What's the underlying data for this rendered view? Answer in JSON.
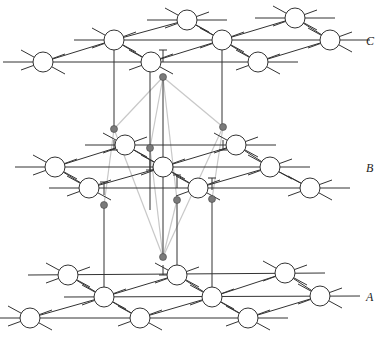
{
  "layers": [
    {
      "label": "C",
      "label_pos": [
        368,
        45
      ],
      "nodes": [
        [
          187,
          20
        ],
        [
          295,
          18
        ],
        [
          114,
          40
        ],
        [
          222,
          40
        ],
        [
          330,
          40
        ],
        [
          43,
          62
        ],
        [
          151,
          62
        ],
        [
          258,
          62
        ]
      ]
    },
    {
      "label": "B",
      "label_pos": [
        368,
        172
      ],
      "nodes": [
        [
          125,
          145
        ],
        [
          236,
          145
        ],
        [
          55,
          167
        ],
        [
          163,
          167
        ],
        [
          270,
          167
        ],
        [
          89,
          188
        ],
        [
          198,
          188
        ],
        [
          310,
          188
        ]
      ]
    },
    {
      "label": "A",
      "label_pos": [
        368,
        301
      ],
      "nodes": [
        [
          68,
          275
        ],
        [
          177,
          275
        ],
        [
          285,
          273
        ],
        [
          104,
          297
        ],
        [
          212,
          297
        ],
        [
          320,
          296
        ],
        [
          30,
          318
        ],
        [
          140,
          318
        ],
        [
          248,
          318
        ]
      ]
    }
  ],
  "sites": [
    [
      163,
      77
    ],
    [
      114,
      129
    ],
    [
      223,
      127
    ],
    [
      150,
      148
    ],
    [
      177,
      200
    ],
    [
      104,
      205
    ],
    [
      212,
      199
    ],
    [
      163,
      257
    ]
  ],
  "colors": {
    "line": "#333333",
    "node_fill": "#ffffff",
    "site": "#7a7a7a",
    "cell": "#c8c8c8"
  }
}
